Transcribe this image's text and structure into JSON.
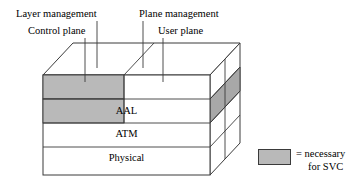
{
  "diagram": {
    "callout_labels": [
      {
        "id": "layer-management",
        "text": "Layer management"
      },
      {
        "id": "control-plane",
        "text": "Control plane"
      },
      {
        "id": "plane-management",
        "text": "Plane management"
      },
      {
        "id": "user-plane",
        "text": "User plane"
      }
    ],
    "layers": [
      {
        "id": "top-unlabeled",
        "text": ""
      },
      {
        "id": "aal",
        "text": "AAL"
      },
      {
        "id": "atm",
        "text": "ATM"
      },
      {
        "id": "physical",
        "text": "Physical"
      }
    ],
    "legend": {
      "swatch_color": "#b9b9b9",
      "line_1": "= necessary",
      "line_2": "for SVC"
    },
    "colors": {
      "highlight_gray": "#b9b9b9",
      "side_gray": "#a8a8a8",
      "stroke": "#3a3a3a",
      "background": "#ffffff"
    }
  }
}
